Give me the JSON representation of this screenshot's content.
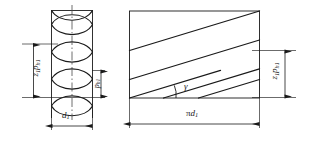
{
  "figure": {
    "background_color": "#ffffff",
    "line_color": "#1a1a1a",
    "centerline_color": "#4a4a4a",
    "left_view": {
      "name": "cylinder-helix-view",
      "description": "Cylinder with helical windings shown as crossing curves",
      "diameter_label": {
        "text": "d1",
        "base": "d",
        "subscript": "1"
      },
      "lead_label": {
        "text": "ph1",
        "base": "p",
        "subscript": "h1"
      },
      "total_lead_label": {
        "text": "z1ph1",
        "base_first": "z",
        "subscript_first": "1",
        "base_second": "p",
        "subscript_second": "h1"
      },
      "turn_count": 3
    },
    "right_view": {
      "name": "unwrapped-development-view",
      "description": "Developed rectangle of the cylinder surface with parallel helix traces",
      "width_label": {
        "text": "pi d1",
        "pi": "π",
        "base": "d",
        "subscript": "1"
      },
      "height_label": {
        "text": "z1ph1",
        "base_first": "z",
        "subscript_first": "1",
        "base_second": "p",
        "subscript_second": "h1"
      },
      "angle_label": {
        "text": "γ",
        "meaning": "lead-angle-gamma"
      },
      "helix_line_count": 4
    }
  }
}
